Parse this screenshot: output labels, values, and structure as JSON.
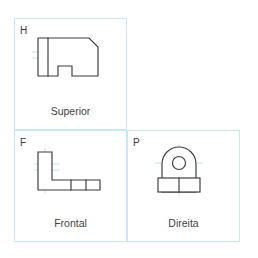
{
  "figure": {
    "type": "orthographic-projection-drawing",
    "background_color": "#ffffff",
    "panel_border_color": "#c8e8f2",
    "line_color": "#3a3a3a",
    "centerline_color": "#b8e2ef"
  },
  "panels": [
    {
      "id": "h",
      "quadrant_letter": "H",
      "view_label": "Superior",
      "shape_name": "top-view-outline"
    },
    {
      "id": "f",
      "quadrant_letter": "F",
      "view_label": "Frontal",
      "shape_name": "front-view-outline"
    },
    {
      "id": "p",
      "quadrant_letter": "P",
      "view_label": "Direita",
      "shape_name": "right-view-outline"
    }
  ],
  "geometry": {
    "top_view": {
      "outline_points": "24,20 75,20 84,29 84,58 58,58 58,48 44,48 44,58 24,58",
      "internal_lines": [
        {
          "x1": 34,
          "y1": 20,
          "x2": 34,
          "y2": 58
        }
      ],
      "center_lines": [
        {
          "x1": 18,
          "y1": 34,
          "x2": 40,
          "y2": 34
        },
        {
          "x1": 18,
          "y1": 40,
          "x2": 40,
          "y2": 40
        }
      ]
    },
    "front_view": {
      "outline_points": "24,22 38,22 38,50 86,50 86,60 24,60",
      "internal_lines": [
        {
          "x1": 57,
          "y1": 50,
          "x2": 57,
          "y2": 60
        },
        {
          "x1": 72,
          "y1": 50,
          "x2": 72,
          "y2": 60
        }
      ],
      "center_lines": [
        {
          "x1": 31,
          "y1": 18,
          "x2": 31,
          "y2": 64
        },
        {
          "x1": 20,
          "y1": 36,
          "x2": 44,
          "y2": 36
        }
      ]
    },
    "right_view": {
      "arch_path": "M 35,62 L 35,34 A 17,17 0 0 1 69,34 L 69,62 Z",
      "base_rect": {
        "x": 31,
        "y": 48,
        "width": 42,
        "height": 14
      },
      "hole": {
        "cx": 52,
        "cy": 33,
        "r": 6.5
      },
      "internal_lines": [
        {
          "x1": 52,
          "y1": 48,
          "x2": 52,
          "y2": 62
        },
        {
          "x1": 35,
          "y1": 48,
          "x2": 69,
          "y2": 48
        }
      ],
      "center_lines": [
        {
          "x1": 52,
          "y1": 14,
          "x2": 52,
          "y2": 66
        },
        {
          "x1": 28,
          "y1": 33,
          "x2": 76,
          "y2": 33
        },
        {
          "x1": 38,
          "y1": 55,
          "x2": 66,
          "y2": 55
        }
      ]
    }
  }
}
